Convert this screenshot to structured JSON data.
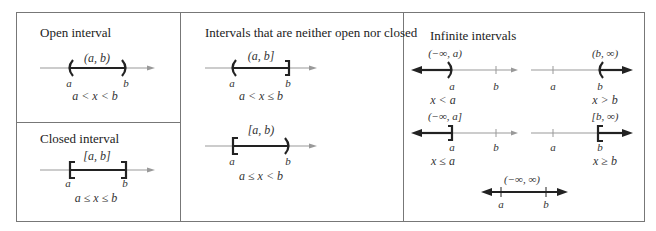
{
  "panels": {
    "open": {
      "title": "Open interval",
      "notation": "(a, b)",
      "left_label": "a",
      "right_label": "b",
      "inequality": "a < x < b"
    },
    "closed": {
      "title": "Closed interval",
      "notation": "[a, b]",
      "left_label": "a",
      "right_label": "b",
      "inequality": "a ≤ x ≤ b"
    },
    "half_open": {
      "title": "Intervals that are neither open nor closed",
      "items": [
        {
          "notation": "(a, b]",
          "left_label": "a",
          "right_label": "b",
          "inequality": "a < x ≤ b"
        },
        {
          "notation": "[a, b)",
          "left_label": "a",
          "right_label": "b",
          "inequality": "a ≤ x < b"
        }
      ]
    },
    "infinite": {
      "title": "Infinite intervals",
      "items": [
        {
          "notation": "(−∞, a)",
          "label_1": "a",
          "label_2": "b",
          "inequality": "x < a"
        },
        {
          "notation": "(b, ∞)",
          "label_1": "a",
          "label_2": "b",
          "inequality": "x > b"
        },
        {
          "notation": "(−∞, a]",
          "label_1": "a",
          "label_2": "b",
          "inequality": "x ≤ a"
        },
        {
          "notation": "[b, ∞)",
          "label_1": "a",
          "label_2": "b",
          "inequality": "x ≥ b"
        },
        {
          "notation": "(−∞, ∞)",
          "label_1": "a",
          "label_2": "b"
        }
      ]
    }
  },
  "colors": {
    "border": "#777777",
    "axis": "#999999",
    "interval": "#222222"
  }
}
